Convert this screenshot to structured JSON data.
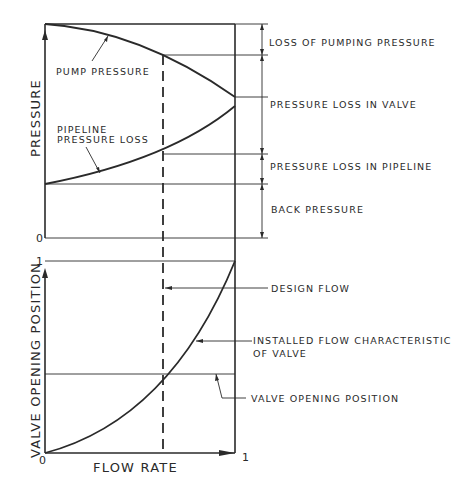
{
  "diagram": {
    "top_panel": {
      "y_axis_label": "PRESSURE",
      "zero_tick": "0",
      "curve_labels": {
        "pump": "PUMP PRESSURE",
        "pipeline_line1": "PIPELINE",
        "pipeline_line2": "PRESSURE LOSS"
      },
      "dimension_labels": {
        "loss_of_pumping": "LOSS OF PUMPING PRESSURE",
        "valve_loss": "PRESSURE LOSS IN VALVE",
        "pipeline_loss": "PRESSURE LOSS IN PIPELINE",
        "back_pressure": "BACK PRESSURE"
      }
    },
    "bottom_panel": {
      "y_axis_label": "VALVE OPENING POSITION",
      "x_axis_label": "FLOW RATE",
      "y_tick_top": "1",
      "origin_tick": "0",
      "x_tick_right": "1",
      "callouts": {
        "design_flow": "DESIGN FLOW",
        "installed_line1": "INSTALLED FLOW CHARACTERISTIC",
        "installed_line2": "OF VALVE",
        "valve_opening": "VALVE OPENING POSITION"
      }
    },
    "colors": {
      "ink": "#2a2a2a",
      "background": "#ffffff"
    }
  }
}
